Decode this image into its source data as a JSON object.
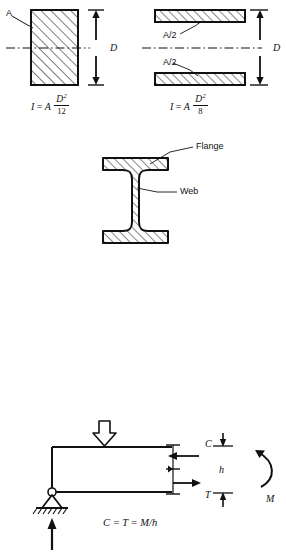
{
  "figure": {
    "title_hidden": "",
    "sections": {
      "top_left": {
        "name": "solid-rectangle-section",
        "area_label": "A",
        "depth_label": "D",
        "formula": {
          "lhs": "I",
          "eq": "=",
          "coef": "A",
          "numerator": "D",
          "numerator_exp": "2",
          "denominator": "12",
          "plain": "I = A D^2 / 12"
        }
      },
      "top_right": {
        "name": "two-flange-section",
        "upper_area_label": "A/2",
        "lower_area_label": "A/2",
        "depth_label": "D",
        "formula": {
          "lhs": "I",
          "eq": "=",
          "coef": "A",
          "numerator": "D",
          "numerator_exp": "2",
          "denominator": "8",
          "plain": "I = A D^2 / 8"
        }
      },
      "middle": {
        "name": "i-beam-section",
        "flange_label": "Flange",
        "web_label": "Web"
      },
      "bottom": {
        "name": "beam-couple-diagram",
        "compression_label": "C",
        "tension_label": "T",
        "depth_label": "h",
        "moment_label": "M",
        "formula": {
          "plain": "C = T = M/h",
          "c": "C",
          "eq1": "=",
          "t": "T",
          "eq2": "=",
          "rhs": "M/h"
        }
      }
    },
    "colors": {
      "line": "#111111",
      "background": "#ffffff",
      "hatch": "#111111"
    }
  }
}
